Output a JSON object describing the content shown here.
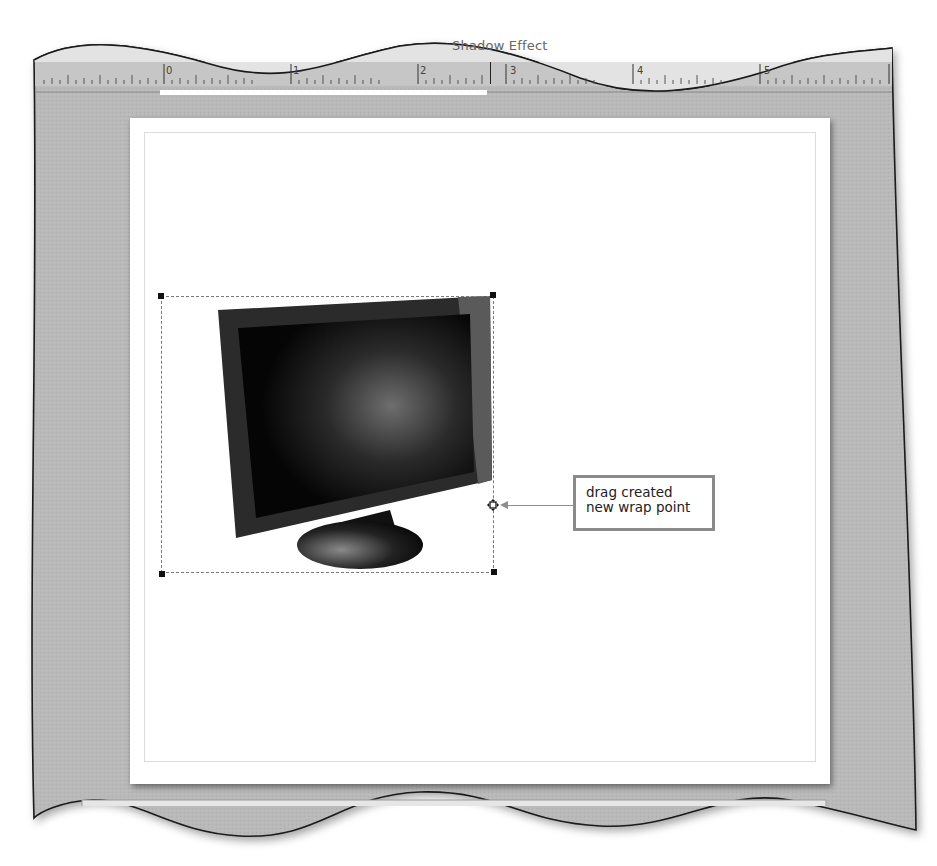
{
  "window": {
    "title_fragment": "Shadow Effect",
    "corner_fragment": "Cl"
  },
  "ruler": {
    "labels": [
      "0",
      "1",
      "2",
      "3",
      "4",
      "5"
    ],
    "units": "inches"
  },
  "document": {
    "image": {
      "icon": "computer-monitor-image",
      "selected": true,
      "wrap_mode": "edit-wrap-points"
    }
  },
  "callout": {
    "line1": "drag created",
    "line2": "new wrap point"
  },
  "colors": {
    "workspace_gray": "#b8b8b8",
    "ruler_gray": "#c4c4c4",
    "callout_border": "#8a8a8a",
    "page": "#ffffff"
  }
}
